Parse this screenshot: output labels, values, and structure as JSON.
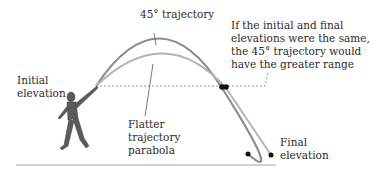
{
  "labels": {
    "trajectory_45": "45° trajectory",
    "initial_elevation_1": "Initial",
    "initial_elevation_2": "elevation",
    "callout_line1": "If the initial and final",
    "callout_line2": "elevations were the same,",
    "callout_line3": "the 45° trajectory would",
    "callout_line4": "have the greater range",
    "flatter_1": "Flatter",
    "flatter_2": "trajectory",
    "flatter_3": "parabola",
    "final_elevation_1": "Final",
    "final_elevation_2": "elevation"
  },
  "colors": {
    "trajectory_45": "#8a8a8a",
    "flatter_trajectory": "#b0b0b0",
    "dots": "#111111",
    "dashed_line": "#777777",
    "ground": "#cfcfcf",
    "figure": "#555555"
  }
}
